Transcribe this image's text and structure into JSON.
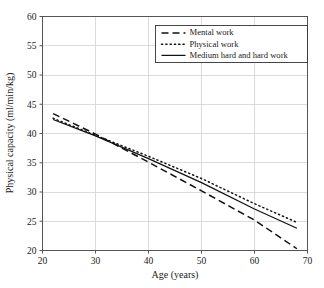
{
  "chart_data": {
    "type": "line",
    "title": "",
    "xlabel": "Age (years)",
    "ylabel": "Physical capacity (ml/min/kg)",
    "xlim": [
      20,
      70
    ],
    "ylim": [
      20,
      60
    ],
    "xticks": [
      20,
      30,
      40,
      50,
      60,
      70
    ],
    "yticks": [
      20,
      25,
      30,
      35,
      40,
      45,
      50,
      55,
      60
    ],
    "grid": true,
    "legend_position": "top-right",
    "series": [
      {
        "name": "Mental work",
        "style": "dashed",
        "color": "#111111",
        "x": [
          22,
          30,
          40,
          50,
          60,
          68
        ],
        "values": [
          43.4,
          39.9,
          35.1,
          30.2,
          25.2,
          20.3
        ]
      },
      {
        "name": "Physical work",
        "style": "dotted",
        "color": "#111111",
        "x": [
          22,
          30,
          40,
          50,
          60,
          68
        ],
        "values": [
          42.6,
          39.7,
          36.1,
          32.3,
          28.0,
          24.8
        ]
      },
      {
        "name": "Medium hard and hard work",
        "style": "solid",
        "color": "#111111",
        "x": [
          22,
          30,
          40,
          50,
          60,
          68
        ],
        "values": [
          42.4,
          39.6,
          35.7,
          31.6,
          27.1,
          23.8
        ]
      }
    ]
  },
  "legend": {
    "entries": [
      {
        "label": "Mental work",
        "style": "dashed"
      },
      {
        "label": "Physical work",
        "style": "dotted"
      },
      {
        "label": "Medium hard and hard work",
        "style": "solid"
      }
    ]
  },
  "axes": {
    "x_title": "Age (years)",
    "y_title": "Physical capacity (ml/min/kg)",
    "x_tick_labels": [
      "20",
      "30",
      "40",
      "50",
      "60",
      "70"
    ],
    "y_tick_labels": [
      "20",
      "25",
      "30",
      "35",
      "40",
      "45",
      "50",
      "55",
      "60"
    ]
  },
  "colors": {
    "background": "#ffffff",
    "grid": "#d2d2d2",
    "axis": "#555555",
    "ink": "#111111"
  }
}
